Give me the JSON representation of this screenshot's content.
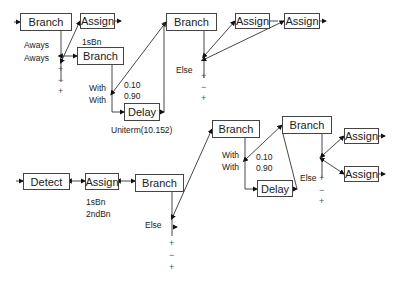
{
  "diagram": {
    "upper": {
      "nodes": [
        {
          "id": "u_branch1",
          "label": "Branch"
        },
        {
          "id": "u_assign1",
          "label": "Assign"
        },
        {
          "id": "u_branch2",
          "label": "Branch"
        },
        {
          "id": "u_delay",
          "label": "Delay"
        },
        {
          "id": "u_branch3",
          "label": "Branch"
        },
        {
          "id": "u_assign2",
          "label": "Assign"
        },
        {
          "id": "u_assign3",
          "label": "Assign"
        }
      ],
      "labels": {
        "aways1": "Aways",
        "aways2": "Aways",
        "assign1_note": "1sBn",
        "with1": "With",
        "with2": "With",
        "p1": "0.10",
        "p2": "0.90",
        "uniterm": "Uniterm(10.152)",
        "else": "Else"
      },
      "signs_a": [
        "+",
        "−",
        "+"
      ],
      "signs_b": [
        "+",
        "−",
        "+"
      ]
    },
    "lower": {
      "nodes": [
        {
          "id": "l_detect",
          "label": "Detect"
        },
        {
          "id": "l_assign1",
          "label": "Assign"
        },
        {
          "id": "l_branch1",
          "label": "Branch"
        },
        {
          "id": "l_branch2",
          "label": "Branch"
        },
        {
          "id": "l_delay",
          "label": "Delay"
        },
        {
          "id": "l_branch3",
          "label": "Branch"
        },
        {
          "id": "l_assign2",
          "label": "Assign"
        },
        {
          "id": "l_assign3",
          "label": "Assign"
        }
      ],
      "labels": {
        "assign_note1": "1sBn",
        "assign_note2": "2ndBn",
        "else1": "Else",
        "with1": "With",
        "with2": "With",
        "p1": "0.10",
        "p2": "0.90",
        "else2": "Else"
      },
      "signs_a": [
        "+",
        "−",
        "+"
      ],
      "signs_b": [
        "+",
        "−",
        "+"
      ]
    }
  }
}
